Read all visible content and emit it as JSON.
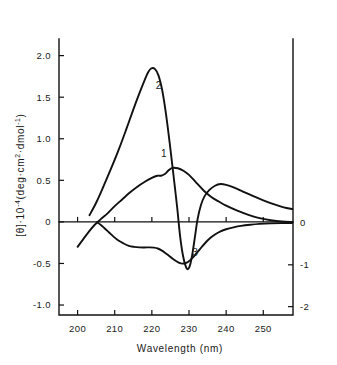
{
  "chart_data": {
    "type": "line",
    "title": "",
    "xlabel": "Wavelength (nm)",
    "ylabel": "[θ]·10⁻⁴(deg·cm²·dmol⁻¹)",
    "ylabel_parts": {
      "theta": "[θ]",
      "dot": "·",
      "ten": "10",
      "exp_minus_four": "-4",
      "open": "(deg·cm",
      "exp_two": "2",
      "middle": "·dmol",
      "exp_minus_one": "-1",
      "close": ")"
    },
    "ylabel_right": "",
    "xlim": [
      195,
      258
    ],
    "ylim": [
      -1.12,
      2.2
    ],
    "ylim_right": [
      -2.2,
      4.4
    ],
    "grid": false,
    "legend_position": "inline-curve-labels",
    "xticks": [
      200,
      210,
      220,
      230,
      240,
      250
    ],
    "xtick_labels": [
      "200",
      "210",
      "220",
      "230",
      "240",
      "250"
    ],
    "yticks_left": [
      -1.0,
      -0.5,
      0,
      0.5,
      1.0,
      1.5,
      2.0
    ],
    "ytick_labels_left": [
      "-1.0",
      "-0.5",
      "0",
      "0.5",
      "1.0",
      "1.5",
      "2.0"
    ],
    "yticks_right": [
      -2,
      -1,
      0
    ],
    "ytick_labels_right": [
      "-2",
      "-1",
      "0"
    ],
    "series": [
      {
        "name": "1",
        "label": "1",
        "label_x": 223.2,
        "label_y": 0.78,
        "axis": "left",
        "points": [
          [
            200.0,
            -0.3
          ],
          [
            201.5,
            -0.21
          ],
          [
            203.0,
            -0.12
          ],
          [
            204.5,
            -0.04
          ],
          [
            206.2,
            0.03
          ],
          [
            208.0,
            0.1
          ],
          [
            210.0,
            0.19
          ],
          [
            212.0,
            0.27
          ],
          [
            214.0,
            0.35
          ],
          [
            216.0,
            0.42
          ],
          [
            218.0,
            0.48
          ],
          [
            220.0,
            0.53
          ],
          [
            221.5,
            0.555
          ],
          [
            222.5,
            0.555
          ],
          [
            223.5,
            0.575
          ],
          [
            224.5,
            0.62
          ],
          [
            225.5,
            0.65
          ],
          [
            227.0,
            0.645
          ],
          [
            228.5,
            0.615
          ],
          [
            230.0,
            0.565
          ],
          [
            232.0,
            0.47
          ],
          [
            234.0,
            0.375
          ],
          [
            236.0,
            0.3
          ],
          [
            238.0,
            0.245
          ],
          [
            240.0,
            0.195
          ],
          [
            243.0,
            0.135
          ],
          [
            246.0,
            0.085
          ],
          [
            249.0,
            0.045
          ],
          [
            252.0,
            0.02
          ],
          [
            255.0,
            0.005
          ],
          [
            257.8,
            0.0
          ]
        ]
      },
      {
        "name": "2",
        "label": "2",
        "label_x": 221.8,
        "label_y": 1.6,
        "axis": "left",
        "points": [
          [
            203.2,
            0.08
          ],
          [
            205.0,
            0.23
          ],
          [
            207.0,
            0.43
          ],
          [
            209.0,
            0.64
          ],
          [
            211.0,
            0.86
          ],
          [
            213.0,
            1.1
          ],
          [
            215.0,
            1.35
          ],
          [
            216.5,
            1.53
          ],
          [
            218.0,
            1.7
          ],
          [
            219.0,
            1.8
          ],
          [
            219.8,
            1.845
          ],
          [
            220.8,
            1.84
          ],
          [
            221.8,
            1.76
          ],
          [
            222.8,
            1.58
          ],
          [
            223.8,
            1.3
          ],
          [
            224.8,
            0.95
          ],
          [
            225.8,
            0.57
          ],
          [
            226.8,
            0.18
          ],
          [
            227.6,
            -0.17
          ],
          [
            228.4,
            -0.41
          ],
          [
            229.2,
            -0.545
          ],
          [
            229.8,
            -0.565
          ],
          [
            230.4,
            -0.5
          ],
          [
            231.0,
            -0.36
          ],
          [
            231.6,
            -0.18
          ],
          [
            232.3,
            0.03
          ],
          [
            233.2,
            0.2
          ],
          [
            234.2,
            0.31
          ],
          [
            235.5,
            0.385
          ],
          [
            237.0,
            0.435
          ],
          [
            238.5,
            0.455
          ],
          [
            240.0,
            0.445
          ],
          [
            242.0,
            0.415
          ],
          [
            244.5,
            0.365
          ],
          [
            247.0,
            0.315
          ],
          [
            250.0,
            0.26
          ],
          [
            253.0,
            0.21
          ],
          [
            255.5,
            0.175
          ],
          [
            257.8,
            0.155
          ]
        ]
      },
      {
        "name": "3",
        "label": "3",
        "label_x": 231.6,
        "label_y": -0.8,
        "axis": "right",
        "points": [
          [
            205.2,
            0.02
          ],
          [
            206.2,
            -0.04
          ],
          [
            207.2,
            -0.12
          ],
          [
            208.4,
            -0.22
          ],
          [
            209.6,
            -0.32
          ],
          [
            211.0,
            -0.42
          ],
          [
            212.4,
            -0.49
          ],
          [
            213.8,
            -0.545
          ],
          [
            215.2,
            -0.57
          ],
          [
            216.6,
            -0.583
          ],
          [
            218.0,
            -0.585
          ],
          [
            219.4,
            -0.582
          ],
          [
            220.6,
            -0.588
          ],
          [
            221.6,
            -0.61
          ],
          [
            222.6,
            -0.655
          ],
          [
            223.6,
            -0.715
          ],
          [
            224.6,
            -0.785
          ],
          [
            225.6,
            -0.855
          ],
          [
            226.6,
            -0.915
          ],
          [
            227.4,
            -0.955
          ],
          [
            228.2,
            -0.972
          ],
          [
            229.0,
            -0.962
          ],
          [
            229.8,
            -0.925
          ],
          [
            230.6,
            -0.865
          ],
          [
            231.5,
            -0.78
          ],
          [
            232.5,
            -0.675
          ],
          [
            233.5,
            -0.565
          ],
          [
            234.6,
            -0.455
          ],
          [
            235.8,
            -0.355
          ],
          [
            237.0,
            -0.275
          ],
          [
            238.5,
            -0.2
          ],
          [
            240.0,
            -0.15
          ],
          [
            242.0,
            -0.105
          ],
          [
            244.0,
            -0.07
          ],
          [
            246.5,
            -0.042
          ],
          [
            249.0,
            -0.022
          ],
          [
            252.0,
            -0.008
          ],
          [
            255.0,
            -0.002
          ],
          [
            257.8,
            0.0
          ]
        ]
      }
    ]
  },
  "figure": {
    "background": "#ffffff",
    "line_color": "#111111",
    "text_color": "#1a1a1a"
  }
}
